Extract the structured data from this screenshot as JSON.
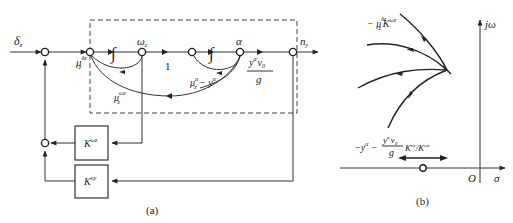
{
  "figure_a": {
    "caption": "(a)",
    "input_label": "δ",
    "input_sub": "z",
    "output_label": "n",
    "output_sub": "y",
    "omega_label": "ω",
    "omega_sub": "z",
    "alpha_label": "α",
    "unity_gain": "1",
    "integrator_symbol": "∫",
    "mu_delta_label": "μ",
    "mu_delta_sup": "δz",
    "mu_delta_sub": "z",
    "mu_alpha_label": "μ",
    "mu_alpha_sup": "α",
    "mu_alpha_sub": "z",
    "mu_alpha_rest": " − y",
    "mu_alpha_rest_sup": "α",
    "mu_omega_label": "μ",
    "mu_omega_sup": "ωz",
    "mu_omega_sub": "z",
    "gain_num": "y",
    "gain_num_sup": "α",
    "gain_num_v": "v",
    "gain_num_v_sub": "0",
    "gain_den": "g",
    "box_omega_label": "K",
    "box_omega_sup": "ωz",
    "box_ny_label": "K",
    "box_ny_sup": "ny"
  },
  "figure_b": {
    "caption": "(b)",
    "axis_imag": "jω",
    "axis_real": "σ",
    "origin": "O",
    "label_top_prefix": "− μ",
    "label_top_sup": "δz",
    "label_top_sub": "z",
    "label_top_K": "K",
    "label_top_K_sup": "ωz",
    "label_bottom_prefix": "−y",
    "label_bottom_prefix_sup": "α",
    "label_bottom_minus": " − ",
    "label_bottom_num": "y",
    "label_bottom_num_sup": "α",
    "label_bottom_num_v": "v",
    "label_bottom_num_v_sub": "0",
    "label_bottom_den": "g",
    "label_bottom_K1": "K",
    "label_bottom_K1_sup": "ny",
    "label_bottom_slash": "/",
    "label_bottom_K2": "K",
    "label_bottom_K2_sup": "ωz"
  }
}
